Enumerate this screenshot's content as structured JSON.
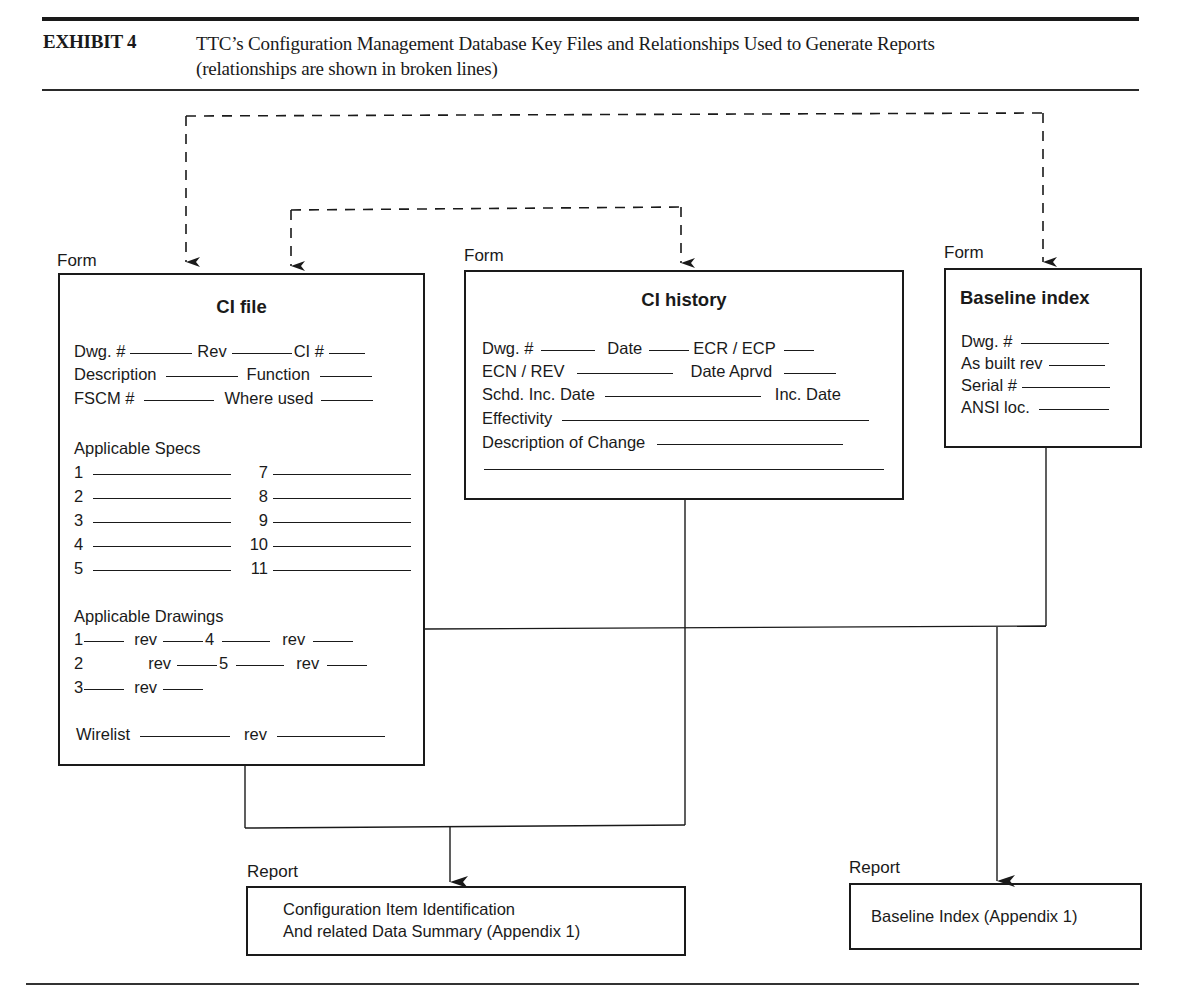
{
  "header": {
    "exhibit_label": "EXHIBIT 4",
    "title_line1": "TTC’s Configuration Management Database Key Files and Relationships Used to Generate Reports",
    "title_line2": "(relationships are shown in broken lines)"
  },
  "forms": {
    "ci_file": {
      "kind_label": "Form",
      "title": "CI file",
      "fields": {
        "dwg": "Dwg. #",
        "rev": "Rev",
        "ci": "CI #",
        "description": "Description",
        "function": "Function",
        "fscm": "FSCM #",
        "where_used": "Where used"
      },
      "specs_heading": "Applicable Specs",
      "specs_left": [
        "1",
        "2",
        "3",
        "4",
        "5"
      ],
      "specs_right": [
        "7",
        "8",
        "9",
        "10",
        "11"
      ],
      "drawings_heading": "Applicable Drawings",
      "drawings": [
        {
          "num": "1",
          "rev": "rev",
          "num2": "4",
          "rev2": "rev"
        },
        {
          "num": "2",
          "rev": "rev",
          "num2": "5",
          "rev2": "rev"
        },
        {
          "num": "3",
          "rev": "rev"
        }
      ],
      "wirelist": "Wirelist",
      "wirelist_rev": "rev"
    },
    "ci_history": {
      "kind_label": "Form",
      "title": "CI history",
      "fields": {
        "dwg": "Dwg. #",
        "date": "Date",
        "ecr_ecp": "ECR / ECP",
        "ecn_rev": "ECN / REV",
        "date_aprvd": "Date Aprvd",
        "schd_inc_date": "Schd. Inc. Date",
        "inc_date": "Inc. Date",
        "effectivity": "Effectivity",
        "description_of_change": "Description of Change"
      }
    },
    "baseline_index": {
      "kind_label": "Form",
      "title": "Baseline index",
      "fields": {
        "dwg": "Dwg. #",
        "as_built_rev": "As built rev",
        "serial": "Serial #",
        "ansi_loc": "ANSI loc."
      }
    }
  },
  "reports": {
    "ci_identification": {
      "kind_label": "Report",
      "line1": "Configuration Item Identification",
      "line2": "And related Data Summary (Appendix 1)"
    },
    "baseline_index": {
      "kind_label": "Report",
      "line1": "Baseline Index (Appendix 1)"
    }
  },
  "relationships": {
    "dashed_meaning": "relationships",
    "solid_meaning": "report generation flow"
  }
}
